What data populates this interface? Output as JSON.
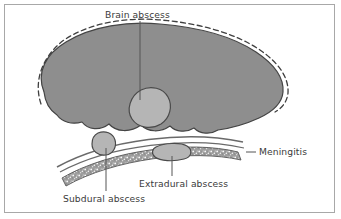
{
  "figure": {
    "title_label": "Brain abscess",
    "type": "medical-illustration",
    "background_color": "#ffffff",
    "frame_color": "#a8a8a8",
    "colors": {
      "brain_fill": "#8e8e8e",
      "abscess_fill": "#b5b5b5",
      "outline": "#444444",
      "skull_fill": "#9a9a9a",
      "label_text": "#3b3b3b",
      "leader_line": "#555555"
    },
    "labels": {
      "brain_abscess": "Brain abscess",
      "meningitis": "Meningitis",
      "extradural_abscess": "Extradural abscess",
      "subdural_abscess": "Subdural abscess"
    },
    "structures": [
      {
        "name": "brain-mass",
        "fill": "#8e8e8e",
        "outline": "#444444"
      },
      {
        "name": "scalp-dashed-outline",
        "style": "dashed",
        "color": "#444444"
      },
      {
        "name": "brain-abscess-blob",
        "fill": "#b5b5b5"
      },
      {
        "name": "subdural-abscess-blob",
        "fill": "#b5b5b5"
      },
      {
        "name": "extradural-abscess-blob",
        "fill": "#b5b5b5"
      },
      {
        "name": "meninges-lines",
        "color": "#666666"
      },
      {
        "name": "skull-bone-band",
        "fill": "#9a9a9a",
        "texture": "stippled"
      }
    ]
  }
}
